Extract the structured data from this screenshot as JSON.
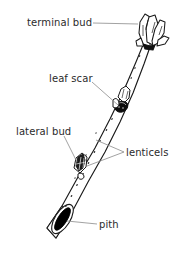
{
  "diagram": {
    "background_color": "#ffffff",
    "line_color": "#1a1a1a",
    "text_color": "#2b2b2b",
    "fill_color": "#000000",
    "labels": [
      {
        "id": "terminal-bud",
        "text": "terminal bud",
        "leader": "horizontal-right"
      },
      {
        "id": "leaf-scar",
        "text": "leaf scar",
        "leader": "diagonal-down-right"
      },
      {
        "id": "lateral-bud",
        "text": "lateral bud",
        "leader": "diagonal-down-right"
      },
      {
        "id": "lenticels",
        "text": "lenticels",
        "leader": "forked-left"
      },
      {
        "id": "pith",
        "text": "pith",
        "leader": "horizontal-left"
      }
    ],
    "parts": [
      {
        "name": "terminal-bud",
        "description": "scaly pointed bud at twig apex"
      },
      {
        "name": "leaf-scar",
        "description": "dark crescent scar below a lateral bud"
      },
      {
        "name": "lateral-bud",
        "description": "small scaly bud on twig side"
      },
      {
        "name": "lenticels",
        "description": "small dots scattered on bark"
      },
      {
        "name": "pith",
        "description": "solid dark core at cut end"
      }
    ]
  }
}
